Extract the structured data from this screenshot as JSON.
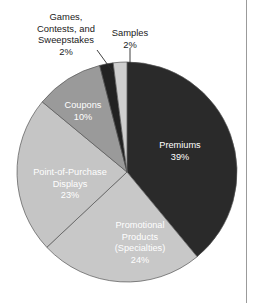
{
  "chart_data": {
    "type": "pie",
    "title": "",
    "subtitle": "",
    "xlabel": "",
    "ylabel": "",
    "legend_position": "none",
    "grid": false,
    "units": "percent",
    "total": 100,
    "categories": [
      "Premiums",
      "Promotional Products (Specialties)",
      "Point-of-Purchase Displays",
      "Coupons",
      "Games, Contests, and Sweepstakes",
      "Samples"
    ],
    "values": [
      39,
      24,
      23,
      10,
      2,
      2
    ],
    "slices": [
      {
        "label": "Premiums",
        "label_lines": [
          "Premiums",
          "39%"
        ],
        "value": 39,
        "value_text": "39%",
        "color": "#2a2a2a",
        "text_color": "#ffffff",
        "label_placement": "inside",
        "start_angle_deg": 0,
        "end_angle_deg": 140.4,
        "label_x": 180,
        "label_y": 148
      },
      {
        "label": "Promotional Products (Specialties)",
        "label_lines": [
          "Promotional",
          "Products",
          "(Specialties)",
          "24%"
        ],
        "value": 24,
        "value_text": "24%",
        "color": "#c8c8c8",
        "text_color": "#ffffff",
        "label_placement": "inside",
        "start_angle_deg": 140.4,
        "end_angle_deg": 226.8,
        "label_x": 140,
        "label_y": 228
      },
      {
        "label": "Point-of-Purchase Displays",
        "label_lines": [
          "Point-of-Purchase",
          "Displays",
          "23%"
        ],
        "value": 23,
        "value_text": "23%",
        "color": "#c5c5c5",
        "text_color": "#ffffff",
        "label_placement": "inside",
        "start_angle_deg": 226.8,
        "end_angle_deg": 309.6,
        "label_x": 70,
        "label_y": 175
      },
      {
        "label": "Coupons",
        "label_lines": [
          "Coupons",
          "10%"
        ],
        "value": 10,
        "value_text": "10%",
        "color": "#9a9a9a",
        "text_color": "#ffffff",
        "label_placement": "inside",
        "start_angle_deg": 309.6,
        "end_angle_deg": 345.6,
        "label_x": 83,
        "label_y": 108
      },
      {
        "label": "Games, Contests, and Sweepstakes",
        "label_lines": [
          "Games,",
          "Contests, and",
          "Sweepstakes",
          "2%"
        ],
        "value": 2,
        "value_text": "2%",
        "color": "#222222",
        "text_color": "#1a1a1a",
        "label_placement": "callout",
        "start_angle_deg": 345.6,
        "end_angle_deg": 352.8,
        "label_x": 66,
        "label_y": 20,
        "leader": {
          "x1": 97,
          "y1": 50,
          "x2": 113,
          "y2": 72
        }
      },
      {
        "label": "Samples",
        "label_lines": [
          "Samples",
          "2%"
        ],
        "value": 2,
        "value_text": "2%",
        "color": "#cfcfcf",
        "text_color": "#1a1a1a",
        "label_placement": "callout",
        "start_angle_deg": 352.8,
        "end_angle_deg": 360,
        "label_x": 130,
        "label_y": 36,
        "leader": {
          "x1": 130,
          "y1": 48,
          "x2": 130,
          "y2": 74
        }
      }
    ],
    "geometry": {
      "center_x": 127,
      "center_y": 172,
      "radius": 110,
      "start_at_top": true,
      "direction": "clockwise"
    }
  }
}
